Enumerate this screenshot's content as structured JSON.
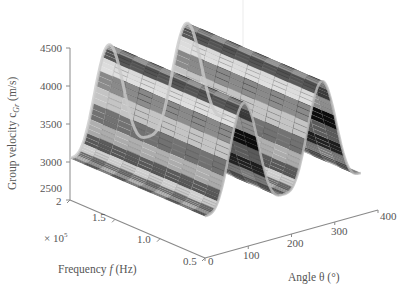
{
  "chart_data": {
    "type": "surface3d",
    "title": "",
    "zlabel": "Group velocity c_Gr (m/s)",
    "ylabel": "Frequency f (Hz)",
    "xlabel": "Angle θ (°)",
    "frequency_multiplier": "× 10^5",
    "z_ticks": [
      2500,
      3000,
      3500,
      4000,
      4500
    ],
    "zlim": [
      2500,
      4500
    ],
    "frequency_ticks": [
      "2",
      "1.5",
      "1.0",
      "0.5"
    ],
    "frequency_range_e5": [
      0.5,
      2
    ],
    "angle_ticks": [
      "0",
      "100",
      "200",
      "300",
      "400"
    ],
    "angle_range": [
      0,
      400
    ],
    "surface_angle_range": [
      0,
      360
    ],
    "colormap": "grayscale",
    "grid": false,
    "series": [
      {
        "name": "Group velocity vs angle (approximately constant along frequency)",
        "angle_deg": [
          0,
          30,
          60,
          90,
          120,
          150,
          180,
          210,
          240,
          270,
          300,
          330,
          360
        ],
        "group_velocity_mps": [
          3050,
          3300,
          4000,
          4400,
          4000,
          3300,
          3050,
          3300,
          4000,
          4400,
          4000,
          3300,
          3050
        ]
      }
    ]
  },
  "labels": {
    "z_axis": "Group velocity c",
    "z_axis_sub": "Gr",
    "z_axis_unit": " (m/s)",
    "freq_axis": "Frequency ",
    "freq_axis_f": "f",
    "freq_axis_unit": " (Hz)",
    "multiplier": "× 10",
    "multiplier_exp": "5",
    "angle_axis": "Angle θ (°)"
  }
}
